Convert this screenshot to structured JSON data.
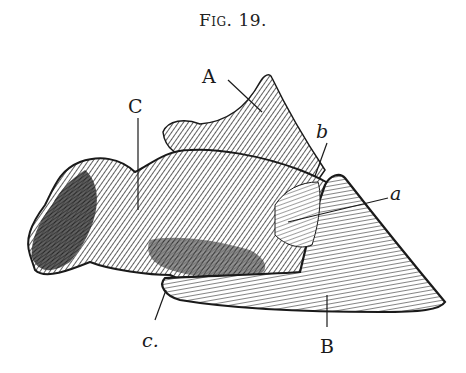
{
  "figure": {
    "caption": "Fig. 19.",
    "caption_prefix": "Fig.",
    "caption_number": "19."
  },
  "labels": [
    {
      "id": "A",
      "text": "A"
    },
    {
      "id": "b",
      "text": "b"
    },
    {
      "id": "C",
      "text": "C"
    },
    {
      "id": "a",
      "text": "a"
    },
    {
      "id": "c",
      "text": "c."
    },
    {
      "id": "B",
      "text": "B"
    }
  ],
  "colors": {
    "ink": "#1a1a1a",
    "paper": "#ffffff",
    "midtone": "#5a5a5a",
    "light": "#d8d8d8"
  }
}
